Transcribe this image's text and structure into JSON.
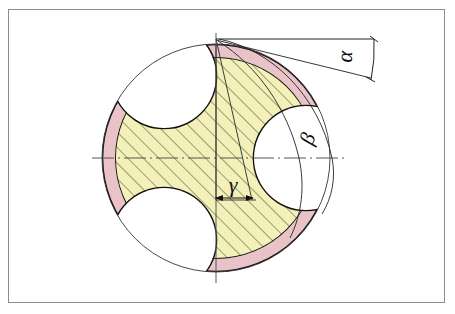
{
  "drawing": {
    "title": "Three-flute drill bit cross-section",
    "frame": {
      "label": "drawing-sheet-border",
      "color": "#8d8d8d"
    },
    "colors": {
      "background": "#ffffff",
      "land_fill": "#f3f1b9",
      "margin_fill": "#e9c3c8",
      "outline": "#111111",
      "thin_line": "#333333",
      "centerline": "#555555",
      "hatch": "#4a4a2a",
      "frame": "#8d8d8d"
    },
    "geometry": {
      "center_x": 216,
      "center_y": 158,
      "outer_radius": 114,
      "flute_count": 3,
      "top_vertex_x": 216,
      "top_vertex_y": 39
    },
    "centerlines": [
      {
        "name": "horizontal-centerline",
        "orientation": "horizontal",
        "style": "dash-dot"
      },
      {
        "name": "vertical-centerline",
        "orientation": "vertical",
        "style": "solid-thin"
      }
    ]
  },
  "annotations": {
    "alpha": {
      "symbol": "α",
      "name": "angle-alpha",
      "description": "helix / rake angle measured at top right between horizontal reference line and inclined chord",
      "x": 352,
      "y": 57
    },
    "beta": {
      "symbol": "β",
      "name": "angle-beta",
      "description": "angle at right where construction arcs cross the horizontal centerline",
      "x": 314,
      "y": 141
    },
    "gamma": {
      "symbol": "γ",
      "name": "angle-gamma",
      "description": "included angle at the centre of the section",
      "x": 233,
      "y": 192
    }
  },
  "features": [
    {
      "name": "land-sector-1",
      "type": "hatched-land",
      "fill": "#f3f1b9",
      "hatched": true
    },
    {
      "name": "land-sector-2",
      "type": "hatched-land",
      "fill": "#f3f1b9",
      "hatched": true
    },
    {
      "name": "land-sector-3",
      "type": "hatched-land",
      "fill": "#f3f1b9",
      "hatched": true
    },
    {
      "name": "margin-strip-1",
      "type": "margin",
      "fill": "#e9c3c8",
      "hatched": false
    },
    {
      "name": "margin-strip-2",
      "type": "margin",
      "fill": "#e9c3c8",
      "hatched": false
    },
    {
      "name": "margin-strip-3",
      "type": "margin",
      "fill": "#e9c3c8",
      "hatched": false
    },
    {
      "name": "flute-cutout-1",
      "type": "flute",
      "fill": "#ffffff",
      "hatched": false
    },
    {
      "name": "flute-cutout-2",
      "type": "flute",
      "fill": "#ffffff",
      "hatched": false
    },
    {
      "name": "flute-cutout-3",
      "type": "flute",
      "fill": "#ffffff",
      "hatched": false
    }
  ]
}
